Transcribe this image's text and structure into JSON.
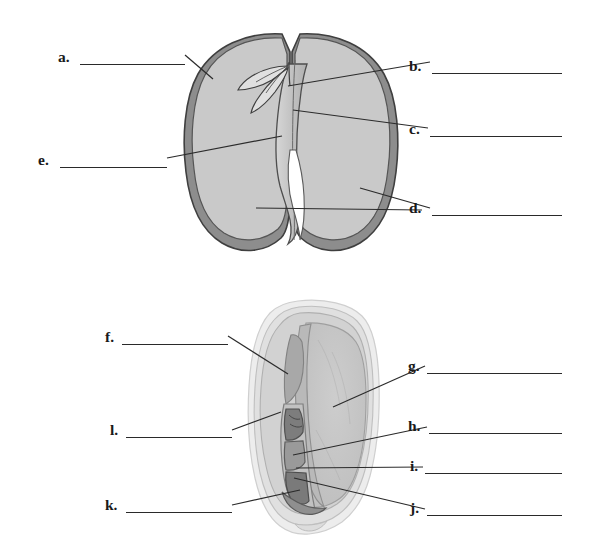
{
  "page": {
    "width": 599,
    "height": 545,
    "background_color": "#ffffff"
  },
  "colors": {
    "ink": "#2a2a2a",
    "label_text": "#1a1a1a",
    "seed_coat_dark": "#6f6f6f",
    "seed_coat_outline": "#4a4a4a",
    "cotyledon_fill": "#c9c9c9",
    "cotyledon_light": "#d8d8d8",
    "embryo_fill": "#bdbdbd",
    "kernel_outer": "#e4e4e4",
    "kernel_pericarp": "#cfcfcf",
    "endosperm_fill": "#c4c4c4",
    "scutellum_fill": "#b4b4b4",
    "embryo_dark": "#8d8d8d",
    "embryo_darker": "#6a6a6a"
  },
  "figures": [
    {
      "id": "figure-dicot-bean-seed",
      "name": "dicot-bean-seed-cross-section",
      "description": "Split bean seed showing two cotyledons, seed coat and embryo",
      "labels": [
        {
          "key": "a",
          "text": "a.",
          "side": "left",
          "x": 58,
          "y": 49,
          "line_x": 80,
          "line_w": 105,
          "blank_value": ""
        },
        {
          "key": "e",
          "text": "e.",
          "side": "left",
          "x": 38,
          "y": 152,
          "line_x": 60,
          "line_w": 107,
          "blank_value": ""
        },
        {
          "key": "b",
          "text": "b.",
          "side": "right",
          "x": 409,
          "y": 58,
          "line_x": 432,
          "line_w": 130,
          "blank_value": ""
        },
        {
          "key": "c",
          "text": "c.",
          "side": "right",
          "x": 409,
          "y": 121,
          "line_x": 430,
          "line_w": 132,
          "blank_value": ""
        },
        {
          "key": "d",
          "text": "d.",
          "side": "right",
          "x": 409,
          "y": 200,
          "line_x": 432,
          "line_w": 130,
          "blank_value": ""
        }
      ]
    },
    {
      "id": "figure-monocot-corn-kernel",
      "name": "monocot-corn-kernel-cross-section",
      "description": "Corn kernel longitudinal section showing endosperm, scutellum and embryo",
      "labels": [
        {
          "key": "f",
          "text": "f.",
          "side": "left",
          "x": 105,
          "y": 329,
          "line_x": 122,
          "line_w": 106,
          "blank_value": ""
        },
        {
          "key": "l",
          "text": "l.",
          "side": "left",
          "x": 110,
          "y": 422,
          "line_x": 126,
          "line_w": 106,
          "blank_value": ""
        },
        {
          "key": "k",
          "text": "k.",
          "side": "left",
          "x": 105,
          "y": 497,
          "line_x": 126,
          "line_w": 106,
          "blank_value": ""
        },
        {
          "key": "g",
          "text": "g.",
          "side": "right",
          "x": 408,
          "y": 358,
          "line_x": 427,
          "line_w": 135,
          "blank_value": ""
        },
        {
          "key": "h",
          "text": "h.",
          "side": "right",
          "x": 408,
          "y": 418,
          "line_x": 429,
          "line_w": 133,
          "blank_value": ""
        },
        {
          "key": "i",
          "text": "i.",
          "side": "right",
          "x": 410,
          "y": 458,
          "line_x": 425,
          "line_w": 137,
          "blank_value": ""
        },
        {
          "key": "j",
          "text": "j.",
          "side": "right",
          "x": 410,
          "y": 500,
          "line_x": 427,
          "line_w": 135,
          "blank_value": ""
        }
      ]
    }
  ]
}
